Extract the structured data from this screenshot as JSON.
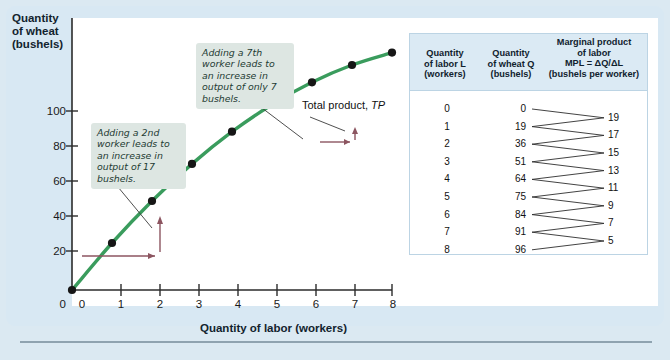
{
  "figure": {
    "y_axis_title": "Quantity of wheat (bushels)",
    "y_axis_title_lines": [
      "Quantity",
      "of wheat",
      "(bushels)"
    ],
    "x_axis_title": "Quantity of labor (workers)",
    "curve_label_text": "Total product, ",
    "curve_label_italic": "TP",
    "callout_1": "Adding a 2nd worker leads to an increase in output of 17 bushels.",
    "callout_2": "Adding a 7th worker leads to an increase in output of only 7 bushels."
  },
  "table": {
    "header": {
      "col1_lines": [
        "Quantity",
        "of labor L",
        "(workers)"
      ],
      "col2_lines": [
        "Quantity",
        "of wheat Q",
        "(bushels)"
      ],
      "col3_lines": [
        "Marginal product",
        "of labor",
        "MPL = ΔQ/ΔL",
        "(bushels per worker)"
      ]
    },
    "rows": [
      {
        "labor": "0",
        "wheat": "0"
      },
      {
        "labor": "1",
        "wheat": "19"
      },
      {
        "labor": "2",
        "wheat": "36"
      },
      {
        "labor": "3",
        "wheat": "51"
      },
      {
        "labor": "4",
        "wheat": "64"
      },
      {
        "labor": "5",
        "wheat": "75"
      },
      {
        "labor": "6",
        "wheat": "84"
      },
      {
        "labor": "7",
        "wheat": "91"
      },
      {
        "labor": "8",
        "wheat": "96"
      }
    ],
    "mpl": [
      "19",
      "17",
      "15",
      "13",
      "11",
      "9",
      "7",
      "5"
    ]
  },
  "colors": {
    "panel_background": "#d8e8f3",
    "plot_background": "#ffffff",
    "curve": "#3a9c5d",
    "point": "#161616",
    "step_arrow": "#8c5560",
    "callout_background": "#dde6e2",
    "table_header_background": "#dbeaf4",
    "table_border": "#bcd4e4",
    "axis": "#2b2b2b"
  },
  "chart_data": {
    "type": "line",
    "title": "",
    "xlabel": "Quantity of labor (workers)",
    "ylabel": "Quantity of wheat (bushels)",
    "xlim": [
      0,
      8
    ],
    "ylim": [
      0,
      110
    ],
    "xticks": [
      "0",
      "1",
      "2",
      "3",
      "4",
      "5",
      "6",
      "7",
      "8"
    ],
    "yticks": [
      "0",
      "20",
      "40",
      "60",
      "80",
      "100"
    ],
    "grid": false,
    "legend": "none",
    "series": [
      {
        "name": "Total product, TP",
        "x": [
          0,
          1,
          2,
          3,
          4,
          5,
          6,
          7,
          8
        ],
        "values": [
          0,
          19,
          36,
          51,
          64,
          75,
          84,
          91,
          96
        ]
      }
    ],
    "marginal_product_of_labor": [
      19,
      17,
      15,
      13,
      11,
      9,
      7,
      5
    ],
    "annotations": [
      {
        "text": "Adding a 2nd worker leads to an increase in output of 17 bushels.",
        "points_to": [
          2,
          36
        ]
      },
      {
        "text": "Adding a 7th worker leads to an increase in output of only 7 bushels.",
        "points_to": [
          7,
          91
        ]
      },
      {
        "text": "Total product, TP",
        "points_to": [
          7,
          91
        ]
      }
    ],
    "step_arrows": [
      {
        "from": [
          1,
          19
        ],
        "to": [
          2,
          36
        ]
      },
      {
        "from": [
          6,
          84
        ],
        "to": [
          7,
          91
        ]
      }
    ]
  }
}
